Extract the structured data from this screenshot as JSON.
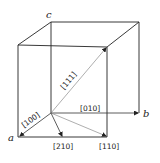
{
  "figure": {
    "type": "cubic unit cell with crystallographic directions",
    "axes": {
      "a": "a",
      "b": "b",
      "c": "c"
    },
    "directions": [
      {
        "id": "100",
        "label": "[100]"
      },
      {
        "id": "010",
        "label": "[010]"
      },
      {
        "id": "111",
        "label": "[111]"
      },
      {
        "id": "210",
        "label": "[210]"
      },
      {
        "id": "110",
        "label": "[110]"
      }
    ],
    "colors": {
      "edge": "#222222",
      "vector": "#333333",
      "background": "#ffffff"
    }
  }
}
